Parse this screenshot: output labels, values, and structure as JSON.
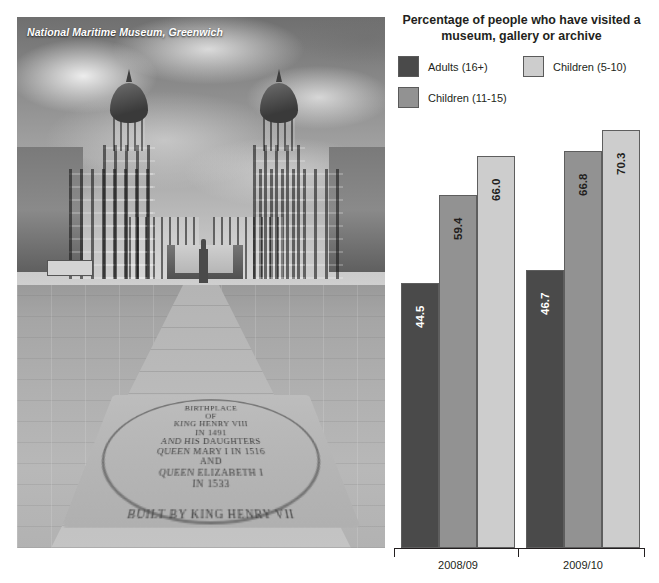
{
  "photo": {
    "caption": "National Maritime Museum, Greenwich",
    "alt_name": "old-royal-naval-college-greenwich-photo",
    "inscription_lines": [
      "BIRTHPLACE",
      "OF",
      "KING HENRY VIII",
      "IN 1491",
      "AND HIS DAUGHTERS",
      "QUEEN MARY I IN 1516",
      "AND",
      "QUEEN ELIZABETH I",
      "IN 1533"
    ],
    "inscription_ring": "ON THIS SITE STOOD THE TUDOR PALACE OF GREENWICH BUILT BY KING HENRY VII"
  },
  "chart": {
    "title": "Percentage of people who have visited a museum, gallery or archive",
    "legend": [
      {
        "label": "Adults (16+)",
        "color": "#4a4a4a"
      },
      {
        "label": "Children (5-10)",
        "color": "#cdcdcd"
      },
      {
        "label": "Children (11-15)",
        "color": "#929292"
      }
    ]
  },
  "chart_data": {
    "type": "bar",
    "title": "Percentage of people who have visited a museum, gallery or archive",
    "xlabel": "",
    "ylabel": "",
    "ylim": [
      0,
      70.3
    ],
    "grid": false,
    "legend_position": "top",
    "categories": [
      "2008/09",
      "2009/10"
    ],
    "series": [
      {
        "name": "Adults (16+)",
        "color": "#4a4a4a",
        "values": [
          44.5,
          46.7
        ],
        "labels": [
          "44.5",
          "46.7"
        ]
      },
      {
        "name": "Children (11-15)",
        "color": "#929292",
        "values": [
          59.4,
          66.8
        ],
        "labels": [
          "59.4",
          "66.8"
        ]
      },
      {
        "name": "Children (5-10)",
        "color": "#cdcdcd",
        "values": [
          66.0,
          70.3
        ],
        "labels": [
          "66.0",
          "70.3"
        ]
      }
    ]
  }
}
